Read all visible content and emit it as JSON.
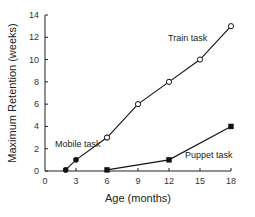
{
  "chart_data": {
    "type": "line",
    "title": "",
    "xlabel": "Age (months)",
    "ylabel": "Maximum Retention (weeks)",
    "xlim": [
      0,
      18
    ],
    "ylim": [
      0,
      14
    ],
    "xticks": [
      0,
      3,
      6,
      9,
      12,
      15,
      18
    ],
    "yticks": [
      0,
      2,
      4,
      6,
      8,
      10,
      12,
      14
    ],
    "grid": false,
    "legend": "none (inline annotations)",
    "series": [
      {
        "name": "Mobile task",
        "marker": "filled-circle",
        "x": [
          2,
          3,
          6
        ],
        "y": [
          0.1,
          1,
          3
        ]
      },
      {
        "name": "Train task",
        "marker": "open-circle",
        "x": [
          6,
          9,
          12,
          15,
          18
        ],
        "y": [
          3,
          6,
          8,
          10,
          13
        ]
      },
      {
        "name": "Puppet task",
        "marker": "filled-square",
        "x": [
          6,
          12,
          18
        ],
        "y": [
          0.1,
          1,
          4
        ]
      }
    ],
    "annotations": [
      {
        "text": "Mobile task",
        "x": 0.8,
        "y": 2.4
      },
      {
        "text": "Train task",
        "x": 12.5,
        "y": 11.6
      },
      {
        "text": "Puppet task",
        "x": 13.5,
        "y": 1.3
      }
    ]
  },
  "labels": {
    "xlabel": "Age (months)",
    "ylabel": "Maximum Retention (weeks)",
    "mobile": "Mobile task",
    "train": "Train task",
    "puppet": "Puppet task"
  },
  "colors": {
    "line": "#111111",
    "axis": "#222222"
  }
}
